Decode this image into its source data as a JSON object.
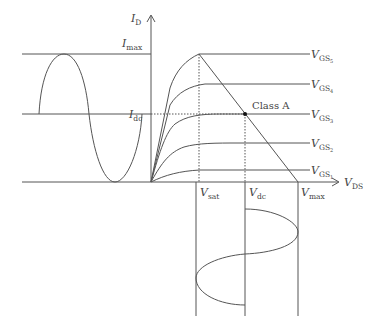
{
  "diagram": {
    "axes": {
      "y_label": {
        "main": "I",
        "sub": "D"
      },
      "x_label": {
        "main": "V",
        "sub": "DS"
      }
    },
    "y_ticks": [
      {
        "main": "I",
        "sub": "max"
      },
      {
        "main": "I",
        "sub": "dc"
      }
    ],
    "x_ticks": [
      {
        "main": "V",
        "sub": "sat"
      },
      {
        "main": "V",
        "sub": "dc"
      },
      {
        "main": "V",
        "sub": "max"
      }
    ],
    "curves": [
      {
        "main": "V",
        "sub": "GS",
        "index": "5"
      },
      {
        "main": "V",
        "sub": "GS",
        "index": "4"
      },
      {
        "main": "V",
        "sub": "GS",
        "index": "3"
      },
      {
        "main": "V",
        "sub": "GS",
        "index": "2"
      },
      {
        "main": "V",
        "sub": "GS",
        "index": "1"
      }
    ],
    "annotation": "Class A",
    "colors": {
      "line": "#555555",
      "point": "#111111"
    }
  }
}
